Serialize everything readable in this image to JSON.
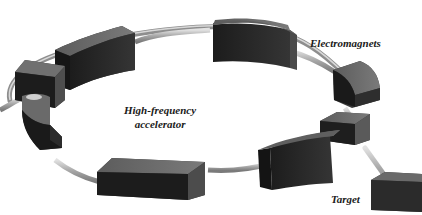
{
  "labels": {
    "electromagnets": "Electromagnets",
    "accelerator_line1": "High-frequency",
    "accelerator_line2": "accelerator",
    "target": "Target"
  },
  "components": [
    {
      "id": "electromagnet",
      "count": 6
    },
    {
      "id": "high-frequency-accelerator",
      "count": 1
    },
    {
      "id": "beam-deflector",
      "count": 2
    },
    {
      "id": "target",
      "count": 1
    },
    {
      "id": "beam-pipe-ring",
      "count": 1
    }
  ],
  "colors": {
    "background": "#ffffff",
    "block_top": "#6e6e6e",
    "block_front": "#2a2a2a",
    "block_side": "#444444",
    "pipe": "#a8a8a8",
    "pipe_highlight": "#dcdcdc",
    "label": "#1a1a1a"
  }
}
